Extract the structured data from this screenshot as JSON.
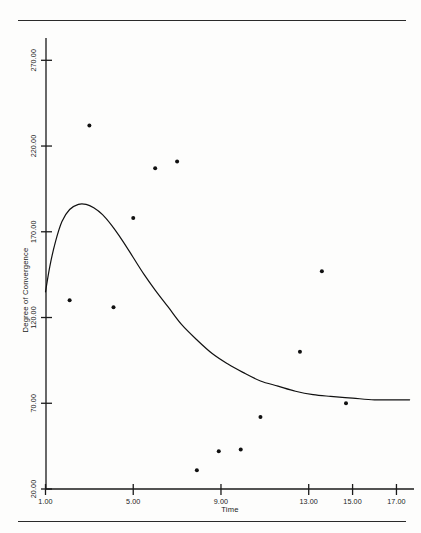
{
  "figure": {
    "background_color": "#fdfdfc",
    "ink_color": "#1a1a1a",
    "top_rule": "",
    "bottom_rule": ""
  },
  "axes": {
    "y_title": "Degree of Convergence",
    "x_title": "Time"
  },
  "chart_data": {
    "type": "scatter",
    "title": "",
    "subtitle": "",
    "xlabel": "Time",
    "ylabel": "Degree of Convergence",
    "xlim": [
      1.0,
      17.8
    ],
    "ylim": [
      20.0,
      283.0
    ],
    "grid": false,
    "legend": "none",
    "x_ticks": [
      1.0,
      5.0,
      9.0,
      13.0,
      15.0,
      17.0
    ],
    "x_tick_labels": [
      "1.00",
      "5.00",
      "9.00",
      "13.00",
      "15.00",
      "17.00"
    ],
    "y_ticks": [
      20.0,
      70.0,
      120.0,
      170.0,
      220.0,
      270.0
    ],
    "y_tick_labels": [
      "20.00",
      "70.00",
      "120.00",
      "170.00",
      "220.00",
      "270.00"
    ],
    "series": [
      {
        "name": "observed",
        "type": "scatter",
        "marker": "filled-circle",
        "marker_size": 4,
        "color": "#111111",
        "points": [
          {
            "x": 2.1,
            "y": 130
          },
          {
            "x": 3.0,
            "y": 232
          },
          {
            "x": 4.1,
            "y": 126
          },
          {
            "x": 5.0,
            "y": 178
          },
          {
            "x": 6.0,
            "y": 207
          },
          {
            "x": 7.0,
            "y": 211
          },
          {
            "x": 7.9,
            "y": 31
          },
          {
            "x": 8.9,
            "y": 42
          },
          {
            "x": 9.9,
            "y": 43
          },
          {
            "x": 10.8,
            "y": 62
          },
          {
            "x": 12.6,
            "y": 100
          },
          {
            "x": 13.6,
            "y": 147
          },
          {
            "x": 14.7,
            "y": 70
          }
        ]
      },
      {
        "name": "fitted-curve",
        "type": "line",
        "color": "#111111",
        "line_width": 1.2,
        "points": [
          {
            "x": 1.0,
            "y": 135
          },
          {
            "x": 1.2,
            "y": 150
          },
          {
            "x": 1.45,
            "y": 164
          },
          {
            "x": 1.75,
            "y": 176
          },
          {
            "x": 2.1,
            "y": 183
          },
          {
            "x": 2.5,
            "y": 186
          },
          {
            "x": 2.85,
            "y": 186
          },
          {
            "x": 3.2,
            "y": 184
          },
          {
            "x": 3.6,
            "y": 180
          },
          {
            "x": 4.0,
            "y": 174
          },
          {
            "x": 4.5,
            "y": 165
          },
          {
            "x": 5.0,
            "y": 155
          },
          {
            "x": 5.5,
            "y": 145
          },
          {
            "x": 6.0,
            "y": 136
          },
          {
            "x": 6.6,
            "y": 126
          },
          {
            "x": 7.2,
            "y": 116
          },
          {
            "x": 7.9,
            "y": 107
          },
          {
            "x": 8.6,
            "y": 99
          },
          {
            "x": 9.3,
            "y": 93
          },
          {
            "x": 10.0,
            "y": 88
          },
          {
            "x": 10.8,
            "y": 83
          },
          {
            "x": 11.6,
            "y": 80
          },
          {
            "x": 12.4,
            "y": 77
          },
          {
            "x": 13.2,
            "y": 75
          },
          {
            "x": 14.0,
            "y": 74
          },
          {
            "x": 15.0,
            "y": 73
          },
          {
            "x": 16.0,
            "y": 72
          },
          {
            "x": 17.0,
            "y": 72
          },
          {
            "x": 17.6,
            "y": 72
          }
        ]
      }
    ]
  }
}
